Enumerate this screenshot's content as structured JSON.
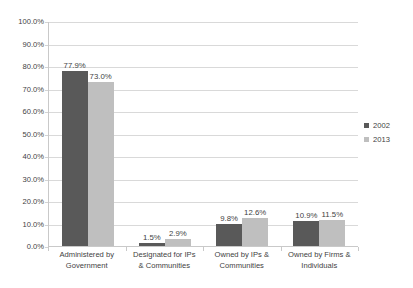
{
  "chart_data": {
    "type": "bar",
    "title": "",
    "subtitle": "",
    "xlabel": "",
    "ylabel": "",
    "ylim": [
      0,
      100
    ],
    "y_tick_labels": [
      "100.0%",
      "90.0%",
      "80.0%",
      "70.0%",
      "60.0%",
      "50.0%",
      "40.0%",
      "30.0%",
      "20.0%",
      "10.0%",
      "0.0%"
    ],
    "y_tick_values": [
      100,
      90,
      80,
      70,
      60,
      50,
      40,
      30,
      20,
      10,
      0
    ],
    "grid": true,
    "legend_position": "right",
    "categories": [
      [
        "Administered by",
        "Government"
      ],
      [
        "Designated for IPs",
        "& Communities"
      ],
      [
        "Owned by IPs &",
        "Communities"
      ],
      [
        "Owned by Firms &",
        "Individuals"
      ]
    ],
    "series": [
      {
        "name": "2002",
        "color": "#595959",
        "values": [
          77.9,
          1.5,
          9.8,
          10.9
        ],
        "labels": [
          "77.9%",
          "1.5%",
          "9.8%",
          "10.9%"
        ]
      },
      {
        "name": "2013",
        "color": "#bfbfbf",
        "values": [
          73.0,
          2.9,
          12.6,
          11.5
        ],
        "labels": [
          "73.0%",
          "2.9%",
          "12.6%",
          "11.5%"
        ]
      }
    ]
  }
}
